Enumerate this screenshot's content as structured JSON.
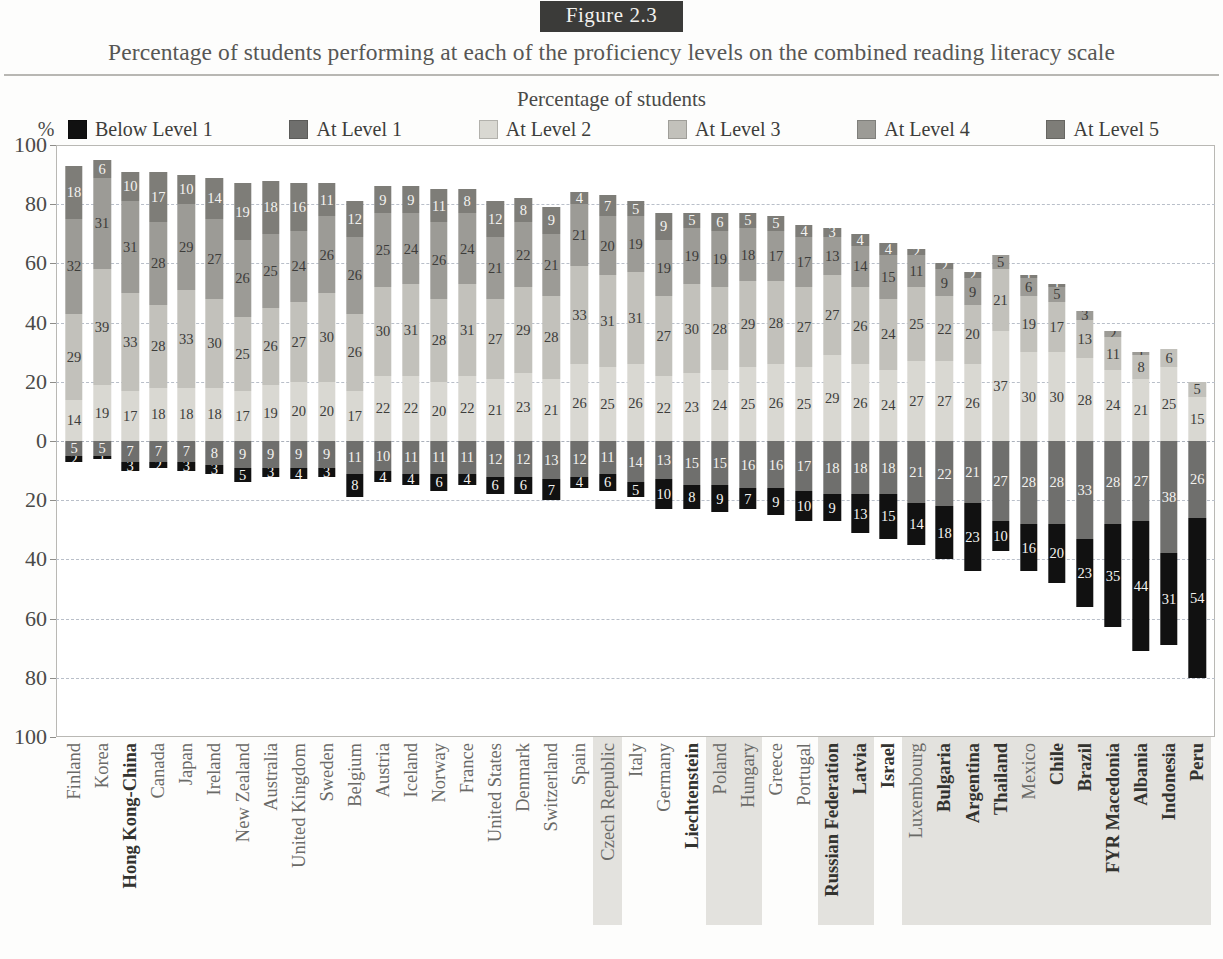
{
  "figure": {
    "badge": "Figure 2.3",
    "title": "Percentage of students performing at each of the proficiency levels on the combined reading literacy scale"
  },
  "legend": {
    "heading": "Percentage of students",
    "percent_symbol": "%",
    "items": [
      {
        "label": "Below Level 1",
        "color": "#111111"
      },
      {
        "label": "At Level 1",
        "color": "#6f6f6d"
      },
      {
        "label": "At Level 2",
        "color": "#d9d8d2"
      },
      {
        "label": "At Level 3",
        "color": "#c2c1bb"
      },
      {
        "label": "At Level 4",
        "color": "#9c9b96"
      },
      {
        "label": "At Level 5",
        "color": "#7e7d78"
      }
    ]
  },
  "yaxis": {
    "ticks": [
      "100",
      "80",
      "60",
      "40",
      "20",
      "0",
      "20",
      "40",
      "60",
      "80",
      "100"
    ],
    "values": [
      100,
      80,
      60,
      40,
      20,
      0,
      -20,
      -40,
      -60,
      -80,
      -100
    ],
    "min": -100,
    "max": 100
  },
  "chart_data": {
    "type": "bar",
    "title": "Percentage of students performing at each of the proficiency levels on the combined reading literacy scale",
    "subtitle": "Figure 2.3",
    "xlabel": "",
    "ylabel": "Percentage of students",
    "ylim": [
      -100,
      100
    ],
    "grid": true,
    "legend_position": "top",
    "stacked": true,
    "note": "Levels 2-5 stack upward from zero; Below Level 1 and Level 1 stack downward from zero.",
    "series": [
      {
        "name": "Below Level 1",
        "direction": "down",
        "color": "#111111"
      },
      {
        "name": "At Level 1",
        "direction": "down",
        "color": "#6f6f6d"
      },
      {
        "name": "At Level 2",
        "direction": "up",
        "color": "#d9d8d2"
      },
      {
        "name": "At Level 3",
        "direction": "up",
        "color": "#c2c1bb"
      },
      {
        "name": "At Level 4",
        "direction": "up",
        "color": "#9c9b96"
      },
      {
        "name": "At Level 5",
        "direction": "up",
        "color": "#7e7d78"
      }
    ],
    "categories": [
      "Finland",
      "Korea",
      "Hong Kong-China",
      "Canada",
      "Japan",
      "Ireland",
      "New Zealand",
      "Australia",
      "United Kingdom",
      "Sweden",
      "Belgium",
      "Austria",
      "Iceland",
      "Norway",
      "France",
      "United States",
      "Denmark",
      "Switzerland",
      "Spain",
      "Czech Republic",
      "Italy",
      "Germany",
      "Liechtenstein",
      "Poland",
      "Hungary",
      "Greece",
      "Portugal",
      "Russian Federation",
      "Latvia",
      "Israel",
      "Luxembourg",
      "Bulgaria",
      "Argentina",
      "Thailand",
      "Mexico",
      "Chile",
      "Brazil",
      "FYR Macedonia",
      "Albania",
      "Indonesia",
      "Peru"
    ],
    "rows": [
      {
        "country": "Finland",
        "bold": false,
        "shaded": false,
        "below1": 2,
        "level1": 5,
        "level2": 14,
        "level3": 29,
        "level4": 32,
        "level5": 18
      },
      {
        "country": "Korea",
        "bold": false,
        "shaded": false,
        "below1": 1,
        "level1": 5,
        "level2": 19,
        "level3": 39,
        "level4": 31,
        "level5": 6
      },
      {
        "country": "Hong Kong-China",
        "bold": true,
        "shaded": false,
        "below1": 3,
        "level1": 7,
        "level2": 17,
        "level3": 33,
        "level4": 31,
        "level5": 10
      },
      {
        "country": "Canada",
        "bold": false,
        "shaded": false,
        "below1": 2,
        "level1": 7,
        "level2": 18,
        "level3": 28,
        "level4": 28,
        "level5": 17
      },
      {
        "country": "Japan",
        "bold": false,
        "shaded": false,
        "below1": 3,
        "level1": 7,
        "level2": 18,
        "level3": 33,
        "level4": 29,
        "level5": 10
      },
      {
        "country": "Ireland",
        "bold": false,
        "shaded": false,
        "below1": 3,
        "level1": 8,
        "level2": 18,
        "level3": 30,
        "level4": 27,
        "level5": 14
      },
      {
        "country": "New Zealand",
        "bold": false,
        "shaded": false,
        "below1": 5,
        "level1": 9,
        "level2": 17,
        "level3": 25,
        "level4": 26,
        "level5": 19
      },
      {
        "country": "Australia",
        "bold": false,
        "shaded": false,
        "below1": 3,
        "level1": 9,
        "level2": 19,
        "level3": 26,
        "level4": 25,
        "level5": 18
      },
      {
        "country": "United Kingdom",
        "bold": false,
        "shaded": false,
        "below1": 4,
        "level1": 9,
        "level2": 20,
        "level3": 27,
        "level4": 24,
        "level5": 16
      },
      {
        "country": "Sweden",
        "bold": false,
        "shaded": false,
        "below1": 3,
        "level1": 9,
        "level2": 20,
        "level3": 30,
        "level4": 26,
        "level5": 11
      },
      {
        "country": "Belgium",
        "bold": false,
        "shaded": false,
        "below1": 8,
        "level1": 11,
        "level2": 17,
        "level3": 26,
        "level4": 26,
        "level5": 12
      },
      {
        "country": "Austria",
        "bold": false,
        "shaded": false,
        "below1": 4,
        "level1": 10,
        "level2": 22,
        "level3": 30,
        "level4": 25,
        "level5": 9
      },
      {
        "country": "Iceland",
        "bold": false,
        "shaded": false,
        "below1": 4,
        "level1": 11,
        "level2": 22,
        "level3": 31,
        "level4": 24,
        "level5": 9
      },
      {
        "country": "Norway",
        "bold": false,
        "shaded": false,
        "below1": 6,
        "level1": 11,
        "level2": 20,
        "level3": 28,
        "level4": 26,
        "level5": 11
      },
      {
        "country": "France",
        "bold": false,
        "shaded": false,
        "below1": 4,
        "level1": 11,
        "level2": 22,
        "level3": 31,
        "level4": 24,
        "level5": 8
      },
      {
        "country": "United States",
        "bold": false,
        "shaded": false,
        "below1": 6,
        "level1": 12,
        "level2": 21,
        "level3": 27,
        "level4": 21,
        "level5": 12
      },
      {
        "country": "Denmark",
        "bold": false,
        "shaded": false,
        "below1": 6,
        "level1": 12,
        "level2": 23,
        "level3": 29,
        "level4": 22,
        "level5": 8
      },
      {
        "country": "Switzerland",
        "bold": false,
        "shaded": false,
        "below1": 7,
        "level1": 13,
        "level2": 21,
        "level3": 28,
        "level4": 21,
        "level5": 9
      },
      {
        "country": "Spain",
        "bold": false,
        "shaded": false,
        "below1": 4,
        "level1": 12,
        "level2": 26,
        "level3": 33,
        "level4": 21,
        "level5": 4
      },
      {
        "country": "Czech Republic",
        "bold": false,
        "shaded": true,
        "below1": 6,
        "level1": 11,
        "level2": 25,
        "level3": 31,
        "level4": 20,
        "level5": 7
      },
      {
        "country": "Italy",
        "bold": false,
        "shaded": false,
        "below1": 5,
        "level1": 14,
        "level2": 26,
        "level3": 31,
        "level4": 19,
        "level5": 5
      },
      {
        "country": "Germany",
        "bold": false,
        "shaded": false,
        "below1": 10,
        "level1": 13,
        "level2": 22,
        "level3": 27,
        "level4": 19,
        "level5": 9
      },
      {
        "country": "Liechtenstein",
        "bold": true,
        "shaded": false,
        "below1": 8,
        "level1": 15,
        "level2": 23,
        "level3": 30,
        "level4": 19,
        "level5": 5
      },
      {
        "country": "Poland",
        "bold": false,
        "shaded": true,
        "below1": 9,
        "level1": 15,
        "level2": 24,
        "level3": 28,
        "level4": 19,
        "level5": 6
      },
      {
        "country": "Hungary",
        "bold": false,
        "shaded": true,
        "below1": 7,
        "level1": 16,
        "level2": 25,
        "level3": 29,
        "level4": 18,
        "level5": 5
      },
      {
        "country": "Greece",
        "bold": false,
        "shaded": false,
        "below1": 9,
        "level1": 16,
        "level2": 26,
        "level3": 28,
        "level4": 17,
        "level5": 5
      },
      {
        "country": "Portugal",
        "bold": false,
        "shaded": false,
        "below1": 10,
        "level1": 17,
        "level2": 25,
        "level3": 27,
        "level4": 17,
        "level5": 4
      },
      {
        "country": "Russian Federation",
        "bold": true,
        "shaded": true,
        "below1": 9,
        "level1": 18,
        "level2": 29,
        "level3": 27,
        "level4": 13,
        "level5": 3
      },
      {
        "country": "Latvia",
        "bold": true,
        "shaded": true,
        "below1": 13,
        "level1": 18,
        "level2": 26,
        "level3": 26,
        "level4": 14,
        "level5": 4
      },
      {
        "country": "Israel",
        "bold": true,
        "shaded": false,
        "below1": 15,
        "level1": 18,
        "level2": 24,
        "level3": 24,
        "level4": 15,
        "level5": 4
      },
      {
        "country": "Luxembourg",
        "bold": false,
        "shaded": true,
        "below1": 14,
        "level1": 21,
        "level2": 27,
        "level3": 25,
        "level4": 11,
        "level5": 2
      },
      {
        "country": "Bulgaria",
        "bold": true,
        "shaded": true,
        "below1": 18,
        "level1": 22,
        "level2": 27,
        "level3": 22,
        "level4": 9,
        "level5": 2
      },
      {
        "country": "Argentina",
        "bold": true,
        "shaded": true,
        "below1": 23,
        "level1": 21,
        "level2": 26,
        "level3": 20,
        "level4": 9,
        "level5": 2
      },
      {
        "country": "Thailand",
        "bold": true,
        "shaded": true,
        "below1": 10,
        "level1": 27,
        "level2": 37,
        "level3": 21,
        "level4": 5,
        "level5": 0
      },
      {
        "country": "Mexico",
        "bold": false,
        "shaded": true,
        "below1": 16,
        "level1": 28,
        "level2": 30,
        "level3": 19,
        "level4": 6,
        "level5": 1
      },
      {
        "country": "Chile",
        "bold": true,
        "shaded": true,
        "below1": 20,
        "level1": 28,
        "level2": 30,
        "level3": 17,
        "level4": 5,
        "level5": 1
      },
      {
        "country": "Brazil",
        "bold": true,
        "shaded": true,
        "below1": 23,
        "level1": 33,
        "level2": 28,
        "level3": 13,
        "level4": 3,
        "level5": 0
      },
      {
        "country": "FYR Macedonia",
        "bold": true,
        "shaded": true,
        "below1": 35,
        "level1": 28,
        "level2": 24,
        "level3": 11,
        "level4": 2,
        "level5": 0
      },
      {
        "country": "Albania",
        "bold": true,
        "shaded": true,
        "below1": 44,
        "level1": 27,
        "level2": 21,
        "level3": 8,
        "level4": 1,
        "level5": 0
      },
      {
        "country": "Indonesia",
        "bold": true,
        "shaded": true,
        "below1": 31,
        "level1": 38,
        "level2": 25,
        "level3": 6,
        "level4": 0,
        "level5": 0
      },
      {
        "country": "Peru",
        "bold": true,
        "shaded": true,
        "below1": 54,
        "level1": 26,
        "level2": 15,
        "level3": 5,
        "level4": 0,
        "level5": 0
      }
    ]
  }
}
